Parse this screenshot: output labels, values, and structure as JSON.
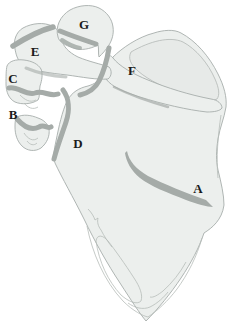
{
  "figure": {
    "labels": [
      {
        "text": "A"
      },
      {
        "text": "B"
      },
      {
        "text": "C"
      },
      {
        "text": "D"
      },
      {
        "text": "E"
      },
      {
        "text": "F"
      },
      {
        "text": "G"
      }
    ],
    "colors": {
      "background": "#ffffff",
      "bone_fill": "#ecefed",
      "bone_fill_shaded": "#e4e7e6",
      "bone_outline": "#a7aeab",
      "fracture_band": "#a5aba8",
      "inner_contour": "#b6bcb9",
      "label_text": "#1b1b1b"
    }
  }
}
